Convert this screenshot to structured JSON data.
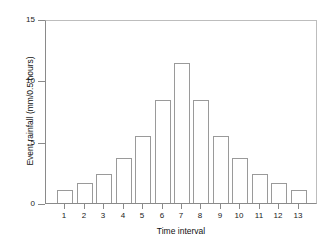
{
  "chart_data": {
    "type": "bar",
    "title": "",
    "subtitle": "",
    "xlabel": "Time interval",
    "ylabel": "Event rainfall (mm/0.5 hours)",
    "categories": [
      "1",
      "2",
      "3",
      "4",
      "5",
      "6",
      "7",
      "8",
      "9",
      "10",
      "11",
      "12",
      "13"
    ],
    "values": [
      1.1,
      1.6,
      2.4,
      3.7,
      5.5,
      8.4,
      11.4,
      8.4,
      5.5,
      3.7,
      2.4,
      1.6,
      1.1
    ],
    "xlim": [
      0.5,
      13.5
    ],
    "ylim": [
      0,
      15
    ],
    "ytick_labels": [
      "0",
      "5",
      "10",
      "15"
    ],
    "ytick_values": [
      0,
      5,
      10,
      15
    ],
    "xtick_labels": [
      "1",
      "2",
      "3",
      "4",
      "5",
      "6",
      "7",
      "8",
      "9",
      "10",
      "11",
      "12",
      "13"
    ],
    "grid": false,
    "legend": false,
    "legend_position": "none",
    "bar_fill_color": "#ffffff",
    "bar_edge_color": "#9a9a9a",
    "axis_color": "#8a8a8a",
    "background_color": "#ffffff",
    "text_color": "#111111"
  }
}
